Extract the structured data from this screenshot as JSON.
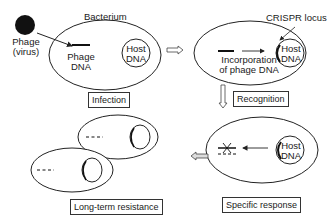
{
  "diagram": {
    "type": "flow",
    "colors": {
      "stroke": "#222222",
      "text": "#1a1a1a",
      "background": "#ffffff"
    },
    "labels": {
      "phage": "Phage",
      "virus": "(virus)",
      "bacterium": "Bacterium",
      "phage_dna_1": "Phage",
      "phage_dna_2": "DNA",
      "host_dna_1": "Host",
      "host_dna_2": "DNA",
      "crispr_locus": "CRISPR locus",
      "incorporation_1": "Incorporation",
      "incorporation_2": "of phage DNA"
    },
    "stages": [
      {
        "id": "infection",
        "label": "Infection"
      },
      {
        "id": "recognition",
        "label": "Recognition"
      },
      {
        "id": "specific_response",
        "label": "Specific response"
      },
      {
        "id": "long_term_resistance",
        "label": "Long-term resistance"
      }
    ],
    "flow": [
      "infection",
      "recognition",
      "specific_response",
      "long_term_resistance"
    ]
  }
}
